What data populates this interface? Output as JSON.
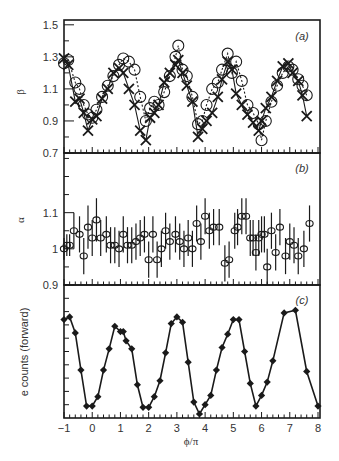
{
  "chart_data": [
    {
      "panel": "(a)",
      "type": "scatter",
      "ylabel": "β",
      "xlabel": "",
      "ylim": [
        0.7,
        1.55
      ],
      "yticks": [
        0.7,
        0.9,
        1.1,
        1.3,
        1.5
      ],
      "ytick_labels": [
        "0.7",
        "0.9",
        "1.1",
        "1.3",
        "1.5"
      ],
      "xlim": [
        -1,
        8
      ],
      "grid": false,
      "series": [
        {
          "name": "circles (dotted)",
          "marker": "circle",
          "line": "dotted",
          "x": [
            -1.0,
            -0.85,
            -0.6,
            -0.45,
            -0.3,
            -0.15,
            0.0,
            0.15,
            0.35,
            0.55,
            0.75,
            0.95,
            1.1,
            1.3,
            1.5,
            1.7,
            1.9,
            2.05,
            2.2,
            2.35,
            2.55,
            2.75,
            2.95,
            3.05,
            3.2,
            3.35,
            3.55,
            3.75,
            3.9,
            4.05,
            4.25,
            4.45,
            4.6,
            4.8,
            4.95,
            5.1,
            5.3,
            5.5,
            5.7,
            5.9,
            6.0,
            6.15,
            6.35,
            6.55,
            6.75,
            6.95,
            7.1,
            7.3,
            7.45,
            7.6
          ],
          "y": [
            1.26,
            1.28,
            1.14,
            1.1,
            1.0,
            0.94,
            0.92,
            0.97,
            1.05,
            1.12,
            1.18,
            1.25,
            1.29,
            1.27,
            1.22,
            1.05,
            0.9,
            0.98,
            1.02,
            1.0,
            1.08,
            1.18,
            1.3,
            1.37,
            1.22,
            1.18,
            1.05,
            0.88,
            0.9,
            1.0,
            1.1,
            1.14,
            1.22,
            1.32,
            1.2,
            1.27,
            1.15,
            1.0,
            0.95,
            0.88,
            0.78,
            0.9,
            1.02,
            1.12,
            1.2,
            1.24,
            1.22,
            1.16,
            1.12,
            1.06
          ]
        },
        {
          "name": "crosses (solid)",
          "marker": "cross",
          "line": "solid",
          "x": [
            -1.0,
            -0.85,
            -0.6,
            -0.45,
            -0.3,
            -0.15,
            0.0,
            0.15,
            0.35,
            0.55,
            0.75,
            0.95,
            1.1,
            1.3,
            1.5,
            1.7,
            1.9,
            2.05,
            2.2,
            2.35,
            2.55,
            2.75,
            2.95,
            3.05,
            3.2,
            3.35,
            3.55,
            3.75,
            3.9,
            4.05,
            4.25,
            4.45,
            4.6,
            4.8,
            4.95,
            5.1,
            5.3,
            5.5,
            5.7,
            5.9,
            6.0,
            6.15,
            6.35,
            6.55,
            6.75,
            6.95,
            7.1,
            7.3,
            7.45,
            7.6
          ],
          "y": [
            1.29,
            1.25,
            1.02,
            1.04,
            0.95,
            0.84,
            0.91,
            0.93,
            1.04,
            1.1,
            1.2,
            1.23,
            1.2,
            1.1,
            1.0,
            0.84,
            0.78,
            0.92,
            0.95,
            1.0,
            1.14,
            1.2,
            1.25,
            1.28,
            1.2,
            1.12,
            1.02,
            0.8,
            0.85,
            0.9,
            0.95,
            1.05,
            1.16,
            1.27,
            1.22,
            1.07,
            1.0,
            0.94,
            0.89,
            0.84,
            0.9,
            0.98,
            1.05,
            1.15,
            1.24,
            1.26,
            1.2,
            1.15,
            1.06,
            0.93
          ]
        }
      ],
      "annotations": [
        "(a)"
      ]
    },
    {
      "panel": "(b)",
      "type": "scatter",
      "ylabel": "α",
      "xlabel": "",
      "ylim": [
        0.9,
        1.2
      ],
      "yticks": [
        0.9,
        1.0,
        1.1
      ],
      "ytick_labels": [
        "0.9",
        "1",
        "1.1"
      ],
      "xlim": [
        -1,
        8
      ],
      "grid": false,
      "series": [
        {
          "name": "α with error bars",
          "marker": "circle",
          "x": [
            -1.0,
            -0.9,
            -0.8,
            -0.65,
            -0.45,
            -0.3,
            -0.15,
            0.0,
            0.15,
            0.3,
            0.5,
            0.65,
            0.8,
            0.95,
            1.1,
            1.25,
            1.4,
            1.55,
            1.7,
            1.85,
            2.0,
            2.15,
            2.3,
            2.45,
            2.6,
            2.75,
            2.95,
            3.1,
            3.25,
            3.4,
            3.55,
            3.7,
            3.85,
            4.0,
            4.15,
            4.3,
            4.5,
            4.7,
            4.85,
            5.05,
            5.15,
            5.3,
            5.45,
            5.6,
            5.7,
            5.8,
            5.9,
            6.0,
            6.1,
            6.2,
            6.35,
            6.5,
            6.65,
            6.85,
            7.0,
            7.15,
            7.3,
            7.5,
            7.7
          ],
          "y": [
            1.0,
            1.01,
            1.01,
            1.05,
            1.04,
            0.98,
            1.06,
            1.03,
            1.08,
            1.03,
            1.04,
            1.01,
            1.01,
            1.0,
            1.04,
            1.01,
            1.01,
            1.02,
            1.03,
            1.04,
            0.97,
            1.04,
            0.97,
            1.0,
            1.05,
            1.02,
            1.04,
            1.02,
            1.0,
            1.03,
            1.0,
            1.07,
            1.02,
            1.09,
            1.05,
            1.06,
            1.06,
            0.96,
            0.97,
            1.05,
            1.06,
            1.09,
            1.09,
            1.03,
            1.03,
            0.99,
            1.03,
            1.04,
            1.04,
            0.95,
            1.05,
            0.99,
            1.06,
            0.98,
            1.02,
            1.01,
            0.98,
            1.0,
            1.07
          ],
          "err": [
            0.03,
            0.03,
            0.03,
            0.05,
            0.05,
            0.05,
            0.06,
            0.05,
            0.06,
            0.05,
            0.05,
            0.05,
            0.05,
            0.05,
            0.05,
            0.05,
            0.05,
            0.05,
            0.05,
            0.05,
            0.05,
            0.05,
            0.05,
            0.05,
            0.05,
            0.05,
            0.05,
            0.05,
            0.05,
            0.05,
            0.05,
            0.05,
            0.05,
            0.05,
            0.05,
            0.05,
            0.05,
            0.05,
            0.05,
            0.05,
            0.05,
            0.05,
            0.05,
            0.05,
            0.05,
            0.05,
            0.05,
            0.05,
            0.05,
            0.05,
            0.05,
            0.05,
            0.05,
            0.05,
            0.05,
            0.05,
            0.05,
            0.05,
            0.05
          ]
        }
      ],
      "annotations": [
        "(b)"
      ]
    },
    {
      "panel": "(c)",
      "type": "line",
      "ylabel": "e counts (forward)",
      "xlabel": "ϕ/π",
      "ylim": [
        0,
        1
      ],
      "yticks": [],
      "xlim": [
        -1,
        8
      ],
      "xticks": [
        -1,
        0,
        1,
        2,
        3,
        4,
        5,
        6,
        7,
        8
      ],
      "xtick_labels": [
        "−1",
        "0",
        "1",
        "2",
        "3",
        "4",
        "5",
        "6",
        "7",
        "8"
      ],
      "grid": false,
      "series": [
        {
          "name": "e counts",
          "marker": "diamond",
          "x": [
            -1.0,
            -0.8,
            -0.6,
            -0.4,
            -0.2,
            0.0,
            0.2,
            0.4,
            0.6,
            0.8,
            1.0,
            1.1,
            1.2,
            1.4,
            1.6,
            1.8,
            2.0,
            2.2,
            2.4,
            2.6,
            2.8,
            3.0,
            3.2,
            3.4,
            3.6,
            3.8,
            4.0,
            4.2,
            4.4,
            4.6,
            4.8,
            5.0,
            5.2,
            5.4,
            5.6,
            5.8,
            6.0,
            6.2,
            6.4,
            6.8,
            7.2,
            7.6,
            8.0
          ],
          "y": [
            0.74,
            0.76,
            0.64,
            0.36,
            0.09,
            0.09,
            0.16,
            0.36,
            0.52,
            0.69,
            0.65,
            0.65,
            0.58,
            0.52,
            0.25,
            0.08,
            0.08,
            0.16,
            0.28,
            0.49,
            0.71,
            0.76,
            0.72,
            0.42,
            0.12,
            0.03,
            0.1,
            0.17,
            0.36,
            0.53,
            0.63,
            0.74,
            0.74,
            0.5,
            0.26,
            0.09,
            0.17,
            0.27,
            0.43,
            0.79,
            0.81,
            0.35,
            0.09
          ]
        }
      ],
      "annotations": [
        "(c)"
      ]
    }
  ],
  "figure": {
    "panels": [
      {
        "tag": "(a)",
        "ylabel": "β"
      },
      {
        "tag": "(b)",
        "ylabel": "α"
      },
      {
        "tag": "(c)",
        "ylabel": "e counts (forward)"
      }
    ],
    "xlabel": "ϕ/π",
    "colors": {
      "ink": "#1a1a1a",
      "text": "#333333",
      "background": "#ffffff"
    }
  }
}
